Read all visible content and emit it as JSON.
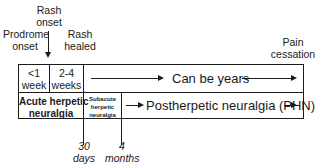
{
  "events": {
    "rash_onset": "Rash\nonset",
    "rash_onset_l1": "Rash",
    "rash_onset_l2": "onset",
    "prodrome_l1": "Prodrome",
    "prodrome_l2": "onset",
    "rash_healed_l1": "Rash",
    "rash_healed_l2": "healed",
    "pain_l1": "Pain",
    "pain_l2": "cessation"
  },
  "durations": {
    "lt1_l1": "<1",
    "lt1_l2": "week",
    "w24_l1": "2-4",
    "w24_l2": "weeks",
    "years": "Can be years"
  },
  "phases": {
    "acute_l1": "Acute herpetic",
    "acute_l2": "neuralgia",
    "subacute_l1": "Subacute",
    "subacute_l2": "herpetic",
    "subacute_l3": "neuralgia",
    "phn": "Postherpetic neuralgia (PHN)"
  },
  "markers": {
    "m30_l1": "30",
    "m30_l2": "days",
    "m4_l1": "4",
    "m4_l2": "months"
  }
}
